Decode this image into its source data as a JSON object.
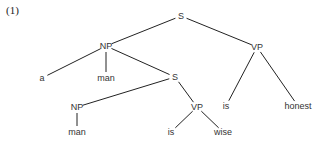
{
  "example_label": "(1)",
  "nodes": [
    {
      "id": "s_root",
      "label": "S",
      "x": 181,
      "y": 16
    },
    {
      "id": "np_top",
      "label": "NP",
      "x": 106,
      "y": 46
    },
    {
      "id": "vp_top",
      "label": "VP",
      "x": 257,
      "y": 47
    },
    {
      "id": "a",
      "label": "a",
      "x": 42,
      "y": 78
    },
    {
      "id": "man_top",
      "label": "man",
      "x": 106,
      "y": 78
    },
    {
      "id": "s_mid",
      "label": "S",
      "x": 175,
      "y": 77
    },
    {
      "id": "is_top",
      "label": "is",
      "x": 226,
      "y": 106
    },
    {
      "id": "honest",
      "label": "honest",
      "x": 298,
      "y": 106
    },
    {
      "id": "np_low",
      "label": "NP",
      "x": 77,
      "y": 107
    },
    {
      "id": "man_low",
      "label": "man",
      "x": 77,
      "y": 132
    },
    {
      "id": "vp_low",
      "label": "VP",
      "x": 197,
      "y": 107
    },
    {
      "id": "is_low",
      "label": "is",
      "x": 171,
      "y": 132
    },
    {
      "id": "wise",
      "label": "wise",
      "x": 223,
      "y": 132
    }
  ],
  "edges": [
    [
      "s_root",
      "np_top"
    ],
    [
      "s_root",
      "vp_top"
    ],
    [
      "np_top",
      "a"
    ],
    [
      "np_top",
      "man_top"
    ],
    [
      "np_top",
      "s_mid"
    ],
    [
      "vp_top",
      "is_top"
    ],
    [
      "vp_top",
      "honest"
    ],
    [
      "s_mid",
      "np_low"
    ],
    [
      "s_mid",
      "vp_low"
    ],
    [
      "np_low",
      "man_low"
    ],
    [
      "vp_low",
      "is_low"
    ],
    [
      "vp_low",
      "wise"
    ]
  ],
  "colors": {
    "line": "#222222",
    "text": "#333333"
  }
}
